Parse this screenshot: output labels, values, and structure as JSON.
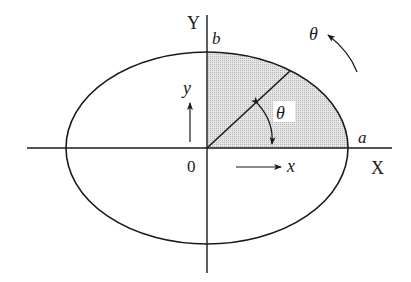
{
  "diagram": {
    "colors": {
      "stroke": "#1a1a1a",
      "shade": "#d8d8d8",
      "background": "#ffffff"
    },
    "labels": {
      "axis_x": "X",
      "axis_y": "Y",
      "origin": "0",
      "semi_major": "a",
      "semi_minor": "b",
      "theta_inner": "θ",
      "theta_outer": "θ",
      "dir_x": "x",
      "dir_y": "y"
    }
  }
}
